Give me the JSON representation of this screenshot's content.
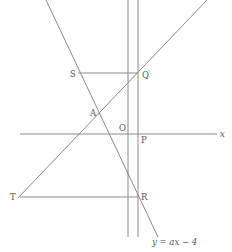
{
  "diagram": {
    "labels": {
      "S": "S",
      "Q": "Q",
      "A": "A",
      "O": "O",
      "P": "P",
      "T": "T",
      "R": "R",
      "x_axis": "x",
      "line_equation": "y = ax − 4"
    },
    "colors": {
      "line": "#8a8a8a",
      "text": "#555555",
      "background": "#ffffff"
    }
  }
}
